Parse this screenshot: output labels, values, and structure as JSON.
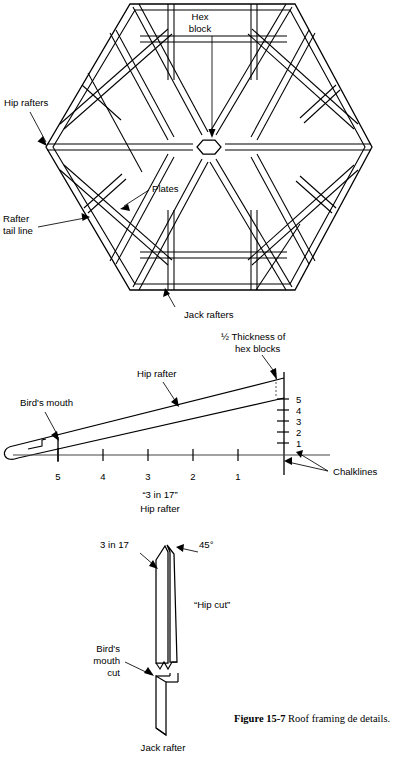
{
  "figure": {
    "number_label": "Figure 15-7",
    "caption_text": "Roof framing de details.",
    "caption_line1": "Roof framing de",
    "caption_line2": "details."
  },
  "panel_hex": {
    "title_hidden": "Hexagonal roof framing plan",
    "labels": {
      "hex_block_line1": "Hex",
      "hex_block_line2": "block",
      "hip_rafters": "Hip rafters",
      "plates": "Plates",
      "rafter_tail_line1": "Rafter",
      "rafter_tail_line2": "tail line",
      "jack_rafters": "Jack rafters"
    }
  },
  "panel_hip": {
    "labels": {
      "half_thickness_line1": "½ Thickness of",
      "half_thickness_line2": "hex blocks",
      "hip_rafter": "Hip rafter",
      "birds_mouth": "Bird's mouth",
      "chalklines": "Chalklines",
      "caption_line1": "“3 in 17”",
      "caption_line2": "Hip rafter"
    },
    "horizontal_ticks": [
      "5",
      "4",
      "3",
      "2",
      "1"
    ],
    "vertical_ticks": [
      "5",
      "4",
      "3",
      "2",
      "1"
    ]
  },
  "panel_jack": {
    "labels": {
      "slope_cut": "3 in 17",
      "angle_cut": "45°",
      "hip_cut": "“Hip cut”",
      "birds_mouth_line1": "Bird's",
      "birds_mouth_line2": "mouth",
      "birds_mouth_line3": "cut",
      "jack_rafter": "Jack rafter"
    }
  },
  "colors": {
    "line": "#000000",
    "background": "#ffffff",
    "leader": "#1a1a1a"
  }
}
